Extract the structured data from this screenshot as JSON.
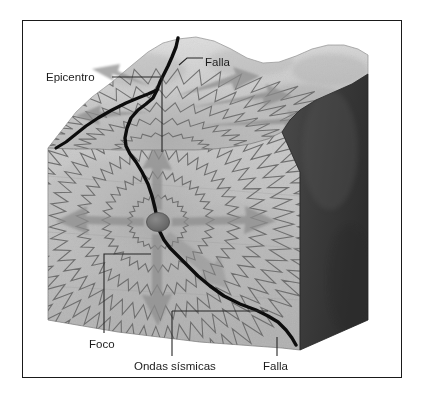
{
  "figure": {
    "kind": "earthquake-block-diagram",
    "language": "es",
    "frame": {
      "border_color": "#1a1a1a"
    },
    "palette": {
      "paper": "#ffffff",
      "text": "#1c1c1c",
      "rock_light": "#cfcfcf",
      "rock_mid": "#bdbdbd",
      "rock_dark": "#a8a8a8",
      "terrain_top": "#d6d6d6",
      "side_shadow": "#3a3a3a",
      "wave_line": "#6e6e6e",
      "arrow": "#8e8e8e",
      "fault": "#0d0d0d",
      "focus_dot": "#707070",
      "leader": "#2a2a2a"
    }
  },
  "labels": [
    {
      "id": "epicentro",
      "text": "Epicentro",
      "x": 46,
      "y": 71,
      "anchor": "start"
    },
    {
      "id": "falla-top",
      "text": "Falla",
      "x": 205,
      "y": 62,
      "anchor": "start"
    },
    {
      "id": "foco",
      "text": "Foco",
      "x": 89,
      "y": 340,
      "anchor": "start"
    },
    {
      "id": "ondas-sismicas",
      "text": "Ondas sísmicas",
      "x": 134,
      "y": 362,
      "anchor": "start"
    },
    {
      "id": "falla-bottom",
      "text": "Falla",
      "x": 265,
      "y": 362,
      "anchor": "start"
    }
  ],
  "features": {
    "epicenter": {
      "label": "Epicentro",
      "x": 162,
      "y": 152
    },
    "focus": {
      "label": "Foco",
      "x": 158,
      "y": 222,
      "radius_x": 11,
      "radius_y": 9
    },
    "fault": {
      "label": "Falla"
    },
    "waves": {
      "label": "Ondas sísmicas",
      "front_rings": 6,
      "top_rings": 4
    }
  },
  "leaders": [
    {
      "id": "leader-epicentro",
      "points": "110,77 162,77 162,152"
    },
    {
      "id": "leader-falla-top",
      "points": "201,58 186,58 180,64"
    },
    {
      "id": "leader-foco",
      "points": "104,333 104,254 150,254 158,230"
    },
    {
      "id": "leader-ondas",
      "points": "172,355 172,318 172,311"
    },
    {
      "id": "leader-ondas-2",
      "points": "172,311 232,311 270,311"
    },
    {
      "id": "leader-falla-bot",
      "points": "277,355 277,338"
    }
  ]
}
